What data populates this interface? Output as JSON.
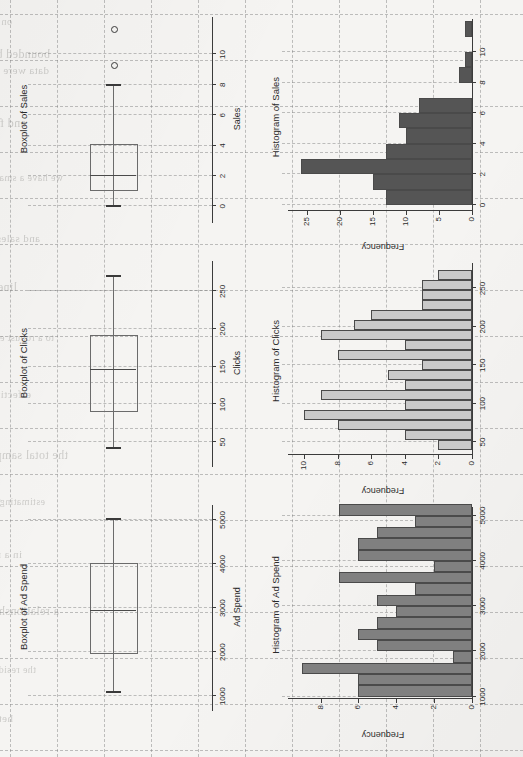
{
  "page": {
    "kind": "scanned-statistics-figure-page",
    "orientation": "rotated-90-ccw",
    "background_hex": "#f5f4f2"
  },
  "ghost_text": [
    "on attribution and in the",
    "data were incomplete in the data",
    "and for the regression",
    "we have a small number of ad",
    "and sales, indicating that sales price for the",
    "linear in the predictor and limit",
    "to a robust estimator. The",
    "effective over both ends of",
    "the total sample distribution",
    "estimating their effect on",
    "in a non-linear structure",
    "a relationship to the outcome",
    "the residual plots show a mild",
    "heteroscedasticity in the sample",
    "bounded by the observed range"
  ],
  "figure": {
    "panels": [
      {
        "id": "boxplot-ad-spend",
        "type": "boxplot",
        "title": "Boxplot of Ad Spend",
        "category_label": "Ad Spend",
        "category_label_visible": "d Spend",
        "axis_label": "",
        "ticks": [
          1000,
          2000,
          3000,
          4000,
          5000
        ],
        "axis_min": 800,
        "axis_max": 5250,
        "stats": {
          "min": 1100,
          "q1": 1950,
          "median": 2950,
          "q3": 3980,
          "max": 5020
        },
        "outliers": []
      },
      {
        "id": "boxplot-clicks",
        "type": "boxplot",
        "title": "Boxplot of Clicks",
        "category_label": "Clicks",
        "category_label_visible": "Clicks",
        "axis_label": "",
        "ticks": [
          50,
          100,
          150,
          200,
          250
        ],
        "axis_min": 25,
        "axis_max": 285,
        "stats": {
          "min": 42,
          "q1": 90,
          "median": 147,
          "q3": 190,
          "max": 270
        },
        "outliers": []
      },
      {
        "id": "boxplot-sales",
        "type": "boxplot",
        "title": "Boxplot of Sales",
        "category_label": "Sales",
        "category_label_visible": "Sales",
        "axis_label": "",
        "ticks": [
          0,
          2,
          4,
          6,
          8,
          10
        ],
        "axis_min": -0.7,
        "axis_max": 12.2,
        "stats": {
          "min": 0,
          "q1": 1,
          "median": 2,
          "q3": 4,
          "max": 8
        },
        "outliers": [
          9.2,
          11.6
        ]
      },
      {
        "id": "histogram-ad-spend",
        "type": "histogram",
        "title": "Histogram of Ad Spend",
        "xlabel": "",
        "ylabel": "Frequency",
        "bar_fill_hex": "#808080",
        "x_ticks": [
          1000,
          2000,
          3000,
          4000,
          5000
        ],
        "y_ticks": [
          0,
          2,
          4,
          6,
          8
        ],
        "x_range": [
          950,
          5100
        ],
        "y_range": [
          0,
          9.4
        ]
      },
      {
        "id": "histogram-clicks",
        "type": "histogram",
        "title": "Histogram of Clicks",
        "xlabel": "",
        "ylabel": "Frequency",
        "bar_fill_hex": "#c9c9c9",
        "x_ticks": [
          50,
          100,
          150,
          200,
          250
        ],
        "y_ticks": [
          0,
          2,
          4,
          6,
          8,
          10
        ],
        "x_range": [
          33,
          278
        ],
        "y_range": [
          0,
          10.6
        ]
      },
      {
        "id": "histogram-sales",
        "type": "histogram",
        "title": "Histogram of Sales",
        "xlabel": "",
        "ylabel": "Frequency",
        "bar_fill_hex": "#555555",
        "x_ticks": [
          0,
          2,
          4,
          6,
          8,
          10
        ],
        "y_ticks": [
          0,
          5,
          10,
          15,
          20,
          25
        ],
        "x_range": [
          -0.4,
          11.9
        ],
        "y_range": [
          0,
          27
        ]
      }
    ]
  },
  "chart_data": [
    {
      "type": "boxplot",
      "title": "Boxplot of Ad Spend",
      "categories": [
        "Ad Spend"
      ],
      "xlabel": "",
      "ylabel": "",
      "ylim": [
        800,
        5250
      ],
      "ticks": [
        1000,
        2000,
        3000,
        4000,
        5000
      ],
      "series": [
        {
          "name": "Ad Spend",
          "min": 1100,
          "q1": 1950,
          "median": 2950,
          "q3": 3980,
          "max": 5020,
          "outliers": []
        }
      ],
      "grid": true,
      "legend": "none"
    },
    {
      "type": "boxplot",
      "title": "Boxplot of Clicks",
      "categories": [
        "Clicks"
      ],
      "xlabel": "",
      "ylabel": "",
      "ylim": [
        25,
        285
      ],
      "ticks": [
        50,
        100,
        150,
        200,
        250
      ],
      "series": [
        {
          "name": "Clicks",
          "min": 42,
          "q1": 90,
          "median": 147,
          "q3": 190,
          "max": 270,
          "outliers": []
        }
      ],
      "grid": true,
      "legend": "none"
    },
    {
      "type": "boxplot",
      "title": "Boxplot of Sales",
      "categories": [
        "Sales"
      ],
      "xlabel": "",
      "ylabel": "",
      "ylim": [
        -0.7,
        12.2
      ],
      "ticks": [
        0,
        2,
        4,
        6,
        8,
        10
      ],
      "series": [
        {
          "name": "Sales",
          "min": 0,
          "q1": 1,
          "median": 2,
          "q3": 4,
          "max": 8,
          "outliers": [
            9.2,
            11.6
          ]
        }
      ],
      "grid": true,
      "legend": "none"
    },
    {
      "type": "bar",
      "subtype": "histogram",
      "title": "Histogram of Ad Spend",
      "xlabel": "",
      "ylabel": "Frequency",
      "xlim": [
        950,
        5100
      ],
      "ylim": [
        0,
        9.4
      ],
      "bin_edges": [
        1000,
        1250,
        1500,
        1750,
        2000,
        2250,
        2500,
        2750,
        3000,
        3250,
        3500,
        3750,
        4000,
        4250,
        4500,
        4750,
        5000
      ],
      "categories": [
        "1000-1250",
        "1250-1500",
        "1500-1750",
        "1750-2000",
        "2000-2250",
        "2250-2500",
        "2500-2750",
        "2750-3000",
        "3000-3250",
        "3250-3500",
        "3500-3750",
        "3750-4000",
        "4000-4250",
        "4250-4500",
        "4500-4750",
        "4750-5000"
      ],
      "values": [
        6,
        6,
        9,
        1,
        5,
        6,
        5,
        4,
        5,
        3,
        7,
        2,
        6,
        6,
        5,
        3,
        7
      ],
      "fill_hex": "#808080",
      "grid": true,
      "legend": "none"
    },
    {
      "type": "bar",
      "subtype": "histogram",
      "title": "Histogram of Clicks",
      "xlabel": "",
      "ylabel": "Frequency",
      "xlim": [
        33,
        278
      ],
      "ylim": [
        0,
        10.6
      ],
      "bin_edges": [
        40,
        53,
        66,
        79,
        92,
        105,
        118,
        131,
        144,
        157,
        170,
        183,
        196,
        209,
        222,
        235,
        248,
        261,
        274
      ],
      "categories": [
        "40-53",
        "53-66",
        "66-79",
        "79-92",
        "92-105",
        "105-118",
        "118-131",
        "131-144",
        "144-157",
        "157-170",
        "170-183",
        "183-196",
        "196-209",
        "209-222",
        "222-235",
        "235-248",
        "248-261",
        "261-274"
      ],
      "values": [
        2,
        4,
        8,
        10,
        4,
        9,
        4,
        5,
        3,
        8,
        4,
        9,
        7,
        6,
        3,
        3,
        3,
        2
      ],
      "fill_hex": "#c9c9c9",
      "grid": true,
      "legend": "none"
    },
    {
      "type": "bar",
      "subtype": "histogram",
      "title": "Histogram of Sales",
      "xlabel": "",
      "ylabel": "Frequency",
      "xlim": [
        -0.4,
        11.9
      ],
      "ylim": [
        0,
        27
      ],
      "bin_edges": [
        0,
        1,
        2,
        3,
        4,
        5,
        6,
        7,
        8,
        9,
        10,
        11,
        12
      ],
      "categories": [
        "0-1",
        "1-2",
        "2-3",
        "3-4",
        "4-5",
        "5-6",
        "6-7",
        "7-8",
        "8-9",
        "9-10",
        "10-11",
        "11-12"
      ],
      "values": [
        13,
        15,
        26,
        13,
        10,
        11,
        8,
        0,
        2,
        1,
        0,
        1
      ],
      "fill_hex": "#555555",
      "grid": true,
      "legend": "none"
    }
  ]
}
